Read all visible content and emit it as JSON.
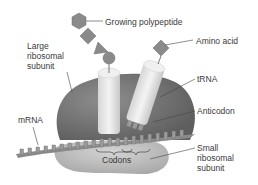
{
  "diagram": {
    "labels": {
      "growing_polypeptide": "Growing polypeptide",
      "amino_acid": "Amino acid",
      "large_subunit": "Large\nribosomal\nsubunit",
      "trna": "tRNA",
      "anticodon": "Anticodon",
      "mrna": "mRNA",
      "codons": "Codons",
      "small_subunit": "Small\nribosomal\nsubunit"
    },
    "colors": {
      "large_subunit": "#7d7d7d",
      "small_subunit": "#c4c4c4",
      "trna": "#e6e6e6",
      "polypeptide": "#8a8a8a",
      "mrna": "#9a9a9a",
      "text": "#3a3a3a"
    }
  }
}
